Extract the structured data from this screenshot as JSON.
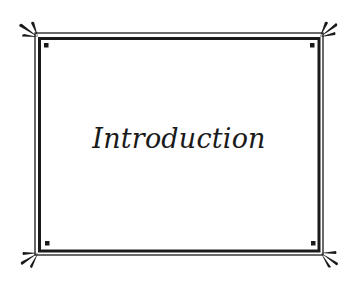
{
  "page": {
    "title": "Introduction"
  },
  "colors": {
    "ink": "#1a1a1a",
    "background": "#ffffff"
  },
  "frame": {
    "style": "double-line border with radiating corner flourishes and corner squares",
    "corner_ornaments": [
      "top-left",
      "top-right",
      "bottom-left",
      "bottom-right"
    ]
  }
}
